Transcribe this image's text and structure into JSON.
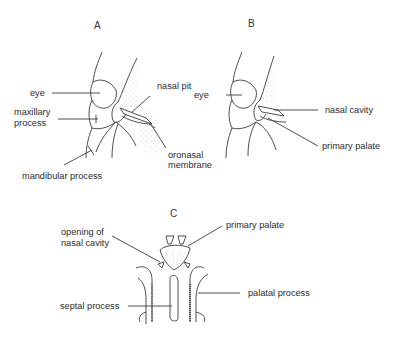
{
  "figure": {
    "panels": [
      {
        "id": "A",
        "letter": "A",
        "labels": {
          "eye": "eye",
          "maxillary_1": "maxillary",
          "maxillary_2": "process",
          "mandibular": "mandibular process",
          "nasal_pit": "nasal pit",
          "oronasal_1": "oronasal",
          "oronasal_2": "membrane"
        }
      },
      {
        "id": "B",
        "letter": "B",
        "labels": {
          "eye": "eye",
          "nasal_cavity": "nasal cavity",
          "primary_palate": "primary palate"
        }
      },
      {
        "id": "C",
        "letter": "C",
        "labels": {
          "opening_1": "opening of",
          "opening_2": "nasal cavity",
          "primary_palate": "primary palate",
          "septal_process": "septal process",
          "palatal_process": "palatal process"
        }
      }
    ],
    "colors": {
      "line": "#3a3a3a",
      "stipple": "#9a9a9a",
      "background": "#ffffff"
    }
  }
}
